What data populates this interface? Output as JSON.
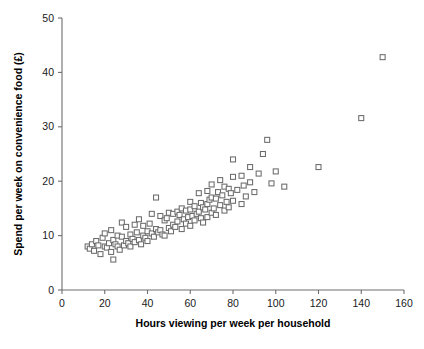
{
  "chart_data": {
    "type": "scatter",
    "title": "",
    "xlabel": "Hours viewing per week per household",
    "ylabel": "Spend per week on convenience food (£)",
    "xlim": [
      0,
      160
    ],
    "ylim": [
      0,
      50
    ],
    "xticks": [
      0,
      20,
      40,
      60,
      80,
      100,
      120,
      140,
      160
    ],
    "yticks": [
      0,
      10,
      20,
      30,
      40,
      50
    ],
    "xtick_labels": [
      "0",
      "20",
      "40",
      "60",
      "80",
      "100",
      "120",
      "140",
      "160"
    ],
    "ytick_labels": [
      "0",
      "10",
      "20",
      "30",
      "40",
      "50"
    ],
    "grid": false,
    "legend": false,
    "marker": "open-square",
    "marker_color": "#6b6b6b",
    "marker_fill": "#ffffff",
    "marker_size": 5,
    "points": [
      [
        12,
        8.0
      ],
      [
        13,
        7.6
      ],
      [
        14,
        8.4
      ],
      [
        15,
        7.2
      ],
      [
        16,
        9.0
      ],
      [
        17,
        8.2
      ],
      [
        18,
        6.6
      ],
      [
        19,
        9.6
      ],
      [
        20,
        8.0
      ],
      [
        20,
        10.4
      ],
      [
        21,
        7.8
      ],
      [
        22,
        8.6
      ],
      [
        23,
        7.0
      ],
      [
        23,
        11.0
      ],
      [
        24,
        9.2
      ],
      [
        24,
        5.6
      ],
      [
        25,
        8.4
      ],
      [
        26,
        10.0
      ],
      [
        26,
        8.0
      ],
      [
        27,
        7.4
      ],
      [
        28,
        9.8
      ],
      [
        28,
        12.4
      ],
      [
        29,
        8.2
      ],
      [
        30,
        9.0
      ],
      [
        30,
        11.6
      ],
      [
        31,
        8.6
      ],
      [
        32,
        10.2
      ],
      [
        32,
        8.0
      ],
      [
        33,
        9.4
      ],
      [
        34,
        8.8
      ],
      [
        34,
        12.0
      ],
      [
        35,
        10.6
      ],
      [
        36,
        9.2
      ],
      [
        36,
        13.0
      ],
      [
        37,
        8.4
      ],
      [
        38,
        10.0
      ],
      [
        38,
        11.8
      ],
      [
        39,
        9.6
      ],
      [
        40,
        10.8
      ],
      [
        40,
        9.0
      ],
      [
        41,
        12.2
      ],
      [
        42,
        10.4
      ],
      [
        42,
        14.0
      ],
      [
        43,
        9.8
      ],
      [
        44,
        11.2
      ],
      [
        44,
        17.0
      ],
      [
        45,
        10.6
      ],
      [
        46,
        13.6
      ],
      [
        46,
        11.0
      ],
      [
        47,
        10.2
      ],
      [
        48,
        12.8
      ],
      [
        48,
        10.0
      ],
      [
        49,
        13.2
      ],
      [
        50,
        11.4
      ],
      [
        50,
        14.2
      ],
      [
        51,
        10.8
      ],
      [
        52,
        14.0
      ],
      [
        52,
        12.0
      ],
      [
        53,
        11.6
      ],
      [
        54,
        14.4
      ],
      [
        54,
        12.6
      ],
      [
        55,
        13.8
      ],
      [
        56,
        11.2
      ],
      [
        56,
        15.0
      ],
      [
        57,
        13.0
      ],
      [
        58,
        14.6
      ],
      [
        58,
        12.2
      ],
      [
        59,
        13.4
      ],
      [
        60,
        14.8
      ],
      [
        60,
        11.8
      ],
      [
        60,
        16.2
      ],
      [
        61,
        13.6
      ],
      [
        62,
        15.4
      ],
      [
        62,
        12.8
      ],
      [
        63,
        14.0
      ],
      [
        64,
        17.8
      ],
      [
        64,
        14.4
      ],
      [
        65,
        13.2
      ],
      [
        65,
        16.0
      ],
      [
        66,
        15.2
      ],
      [
        66,
        12.4
      ],
      [
        67,
        14.8
      ],
      [
        68,
        18.2
      ],
      [
        68,
        15.8
      ],
      [
        68,
        13.4
      ],
      [
        69,
        16.6
      ],
      [
        70,
        14.2
      ],
      [
        70,
        19.4
      ],
      [
        70,
        17.0
      ],
      [
        71,
        15.0
      ],
      [
        72,
        16.8
      ],
      [
        72,
        13.8
      ],
      [
        73,
        18.0
      ],
      [
        74,
        15.6
      ],
      [
        74,
        20.2
      ],
      [
        75,
        17.4
      ],
      [
        76,
        14.6
      ],
      [
        76,
        19.0
      ],
      [
        77,
        16.2
      ],
      [
        78,
        18.6
      ],
      [
        78,
        15.2
      ],
      [
        79,
        17.8
      ],
      [
        80,
        20.8
      ],
      [
        80,
        16.4
      ],
      [
        80,
        24.0
      ],
      [
        82,
        18.4
      ],
      [
        84,
        15.8
      ],
      [
        84,
        21.0
      ],
      [
        85,
        19.2
      ],
      [
        86,
        17.2
      ],
      [
        88,
        22.6
      ],
      [
        88,
        19.8
      ],
      [
        90,
        18.0
      ],
      [
        92,
        21.4
      ],
      [
        94,
        25.0
      ],
      [
        96,
        27.6
      ],
      [
        98,
        19.6
      ],
      [
        100,
        21.8
      ],
      [
        104,
        19.0
      ],
      [
        120,
        22.6
      ],
      [
        140,
        31.6
      ],
      [
        150,
        42.8
      ]
    ]
  }
}
